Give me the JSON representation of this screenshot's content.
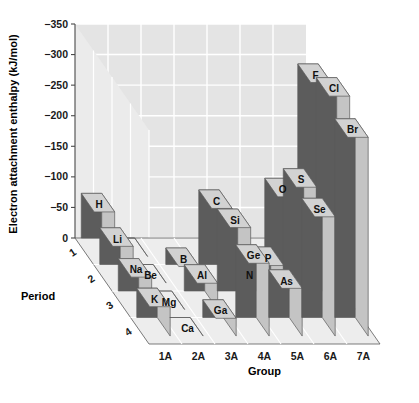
{
  "chart_data": {
    "type": "bar",
    "title": "",
    "xlabel": "Group",
    "ylabel": "Electron attachment enthalpy (kJ/mol)",
    "zlabel": "Period",
    "projection": "3d-bar",
    "grid": true,
    "legend": "none",
    "categories": [
      "1A",
      "2A",
      "3A",
      "4A",
      "5A",
      "6A",
      "7A"
    ],
    "periods": [
      "1",
      "2",
      "3",
      "4"
    ],
    "ylim": [
      0,
      -350
    ],
    "yticks": [
      "0",
      "-50",
      "-100",
      "-150",
      "-200",
      "-250",
      "-300",
      "-350"
    ],
    "ytick_values": [
      0,
      -50,
      -100,
      -150,
      -200,
      -250,
      -300,
      -350
    ],
    "series": [
      {
        "name": "1",
        "values": [
          -73,
          0,
          null,
          null,
          null,
          null,
          null
        ],
        "labels": [
          "H",
          "",
          "",
          "",
          "",
          "",
          ""
        ]
      },
      {
        "name": "2",
        "values": [
          -60,
          0,
          -27,
          -122,
          0,
          -141,
          -328
        ],
        "labels": [
          "Li",
          "Be",
          "B",
          "C",
          "N",
          "O",
          "F"
        ]
      },
      {
        "name": "3",
        "values": [
          -53,
          0,
          -43,
          -134,
          -72,
          -200,
          -349
        ],
        "labels": [
          "Na",
          "Mg",
          "Al",
          "Si",
          "P",
          "S",
          "Cl"
        ]
      },
      {
        "name": "4",
        "values": [
          -48,
          0,
          -29,
          -119,
          -78,
          -195,
          -325
        ],
        "labels": [
          "K",
          "Ca",
          "Ga",
          "Ge",
          "As",
          "Se",
          "Br"
        ]
      }
    ]
  },
  "colors": {
    "bar_front": "#5c5c5c",
    "bar_top": "#d2d2d2",
    "bar_side": "#c4c4c4",
    "wall_back": "#e4e4e4",
    "wall_side": "#ebebeb",
    "floor": "#ededed",
    "grid": "#ffffff",
    "outline": "#5a5a5a",
    "text": "#111111"
  }
}
